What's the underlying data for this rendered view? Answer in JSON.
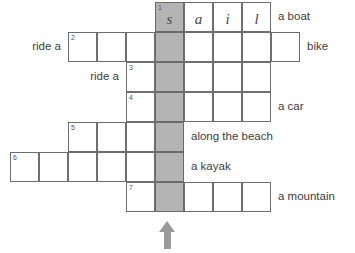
{
  "grid": {
    "origin_x": 10,
    "origin_y": 2,
    "cell_w": 29,
    "cell_h": 30,
    "shaded_col": 5,
    "shade_color": "#b4b4b4",
    "border_color": "#6e6e6e",
    "rows": [
      {
        "number": "1",
        "start_col": 5,
        "cells": [
          {
            "letter": "s",
            "shaded": true
          },
          {
            "letter": "a",
            "shaded": false
          },
          {
            "letter": "i",
            "shaded": false
          },
          {
            "letter": "l",
            "shaded": false
          }
        ],
        "clue_left": "",
        "clue_right": "a boat"
      },
      {
        "number": "2",
        "start_col": 2,
        "cells": [
          {
            "letter": "",
            "shaded": false
          },
          {
            "letter": "",
            "shaded": false
          },
          {
            "letter": "",
            "shaded": false
          },
          {
            "letter": "",
            "shaded": true
          },
          {
            "letter": "",
            "shaded": false
          },
          {
            "letter": "",
            "shaded": false
          },
          {
            "letter": "",
            "shaded": false
          },
          {
            "letter": "",
            "shaded": false
          }
        ],
        "clue_left": "ride a",
        "clue_right": "bike"
      },
      {
        "number": "3",
        "start_col": 4,
        "cells": [
          {
            "letter": "",
            "shaded": false
          },
          {
            "letter": "",
            "shaded": true
          },
          {
            "letter": "",
            "shaded": false
          },
          {
            "letter": "",
            "shaded": false
          },
          {
            "letter": "",
            "shaded": false
          }
        ],
        "clue_left": "ride a",
        "clue_right": ""
      },
      {
        "number": "4",
        "start_col": 4,
        "cells": [
          {
            "letter": "",
            "shaded": false
          },
          {
            "letter": "",
            "shaded": true
          },
          {
            "letter": "",
            "shaded": false
          },
          {
            "letter": "",
            "shaded": false
          },
          {
            "letter": "",
            "shaded": false
          }
        ],
        "clue_left": "",
        "clue_right": "a car"
      },
      {
        "number": "5",
        "start_col": 2,
        "cells": [
          {
            "letter": "",
            "shaded": false
          },
          {
            "letter": "",
            "shaded": false
          },
          {
            "letter": "",
            "shaded": false
          },
          {
            "letter": "",
            "shaded": true
          }
        ],
        "clue_left": "",
        "clue_right": "along the beach"
      },
      {
        "number": "6",
        "start_col": 0,
        "cells": [
          {
            "letter": "",
            "shaded": false
          },
          {
            "letter": "",
            "shaded": false
          },
          {
            "letter": "",
            "shaded": false
          },
          {
            "letter": "",
            "shaded": false
          },
          {
            "letter": "",
            "shaded": false
          },
          {
            "letter": "",
            "shaded": true
          }
        ],
        "clue_left": "",
        "clue_right": "a kayak"
      },
      {
        "number": "7",
        "start_col": 4,
        "cells": [
          {
            "letter": "",
            "shaded": false
          },
          {
            "letter": "",
            "shaded": true
          },
          {
            "letter": "",
            "shaded": false
          },
          {
            "letter": "",
            "shaded": false
          },
          {
            "letter": "",
            "shaded": false
          }
        ],
        "clue_left": "",
        "clue_right": "a mountain"
      }
    ]
  },
  "arrow": {
    "name": "up-arrow-indicator",
    "color": "#9a9a9a",
    "direction": "up"
  }
}
